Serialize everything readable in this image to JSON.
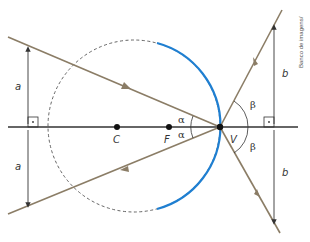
{
  "diagram": {
    "type": "convex-mirror-ray-diagram",
    "colors": {
      "ray": "#8b7d66",
      "mirror": "#1f7fd1",
      "axis": "#333333",
      "dashed_circle": "#555555",
      "dimension": "#333333"
    },
    "points": {
      "center": {
        "label": "C",
        "x": 117,
        "y": 127
      },
      "focus": {
        "label": "F",
        "x": 169,
        "y": 127
      },
      "vertex": {
        "label": "V",
        "x": 220,
        "y": 127
      }
    },
    "angles": {
      "incident_left": "α",
      "reflected_right": "β"
    },
    "dimensions": {
      "left_upper": "a",
      "left_lower": "a",
      "right_upper": "b",
      "right_lower": "b"
    },
    "credit": "Banco de imagens/"
  }
}
